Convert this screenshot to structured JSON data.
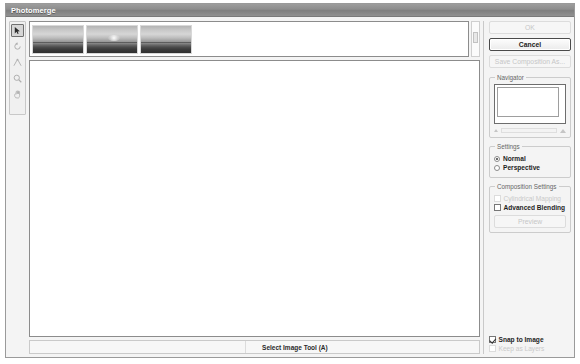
{
  "window": {
    "title": "Photomerge"
  },
  "toolbar": {
    "tools": [
      {
        "name": "select-image-tool",
        "label": "Select Image Tool",
        "shortcut": "A",
        "active": true
      },
      {
        "name": "rotate-image-tool",
        "label": "Rotate Image Tool",
        "shortcut": "R",
        "active": false
      },
      {
        "name": "vanishing-point-tool",
        "label": "Set Vanishing Point Tool",
        "shortcut": "V",
        "active": false
      },
      {
        "name": "zoom-tool",
        "label": "Zoom Tool",
        "shortcut": "Z",
        "active": false
      },
      {
        "name": "hand-tool",
        "label": "Hand Tool",
        "shortcut": "H",
        "active": false
      }
    ]
  },
  "lightbox": {
    "thumbnails": [
      {
        "name": "thumbnail-1",
        "caption": "sunset-horizon-left"
      },
      {
        "name": "thumbnail-2",
        "caption": "sunset-horizon-center"
      },
      {
        "name": "thumbnail-3",
        "caption": "sunset-horizon-right"
      }
    ]
  },
  "status": {
    "message": "Select Image Tool (A)"
  },
  "buttons": {
    "ok": {
      "label": "OK",
      "disabled": true
    },
    "cancel": {
      "label": "Cancel",
      "disabled": false
    },
    "save_composition": {
      "label": "Save Composition As...",
      "disabled": true
    },
    "preview": {
      "label": "Preview",
      "disabled": true
    }
  },
  "navigator": {
    "title": "Navigator",
    "zoom_out_icon": "small-triangle-icon",
    "zoom_in_icon": "large-triangle-icon"
  },
  "settings": {
    "title": "Settings",
    "options": [
      {
        "label": "Normal",
        "checked": true
      },
      {
        "label": "Perspective",
        "checked": false
      }
    ]
  },
  "composition_settings": {
    "title": "Composition Settings",
    "cylindrical_mapping": {
      "label": "Cylindrical Mapping",
      "checked": false,
      "disabled": true
    },
    "advanced_blending": {
      "label": "Advanced Blending",
      "checked": false,
      "disabled": false
    }
  },
  "bottom_options": {
    "snap_to_image": {
      "label": "Snap to Image",
      "checked": true,
      "disabled": false
    },
    "keep_as_layers": {
      "label": "Keep as Layers",
      "checked": false,
      "disabled": true
    }
  },
  "colors": {
    "title_bar": "#8e8e8e",
    "window_bg": "#f4f4f4",
    "canvas": "#ffffff",
    "border": "#8c8c8c"
  }
}
